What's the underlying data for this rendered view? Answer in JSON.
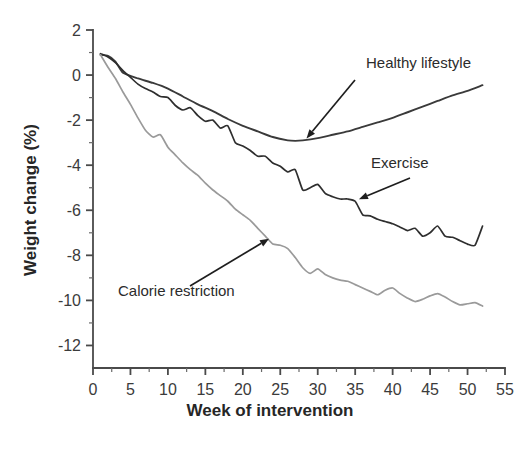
{
  "chart_data": {
    "type": "line",
    "title": "",
    "xlabel": "Week of intervention",
    "ylabel": "Weight change (%)",
    "xlim": [
      0,
      55
    ],
    "ylim": [
      -13,
      2
    ],
    "xticks": [
      0,
      5,
      10,
      15,
      20,
      25,
      30,
      35,
      40,
      45,
      50,
      55
    ],
    "xtick_labels": [
      "0",
      "5",
      "10",
      "15",
      "20",
      "25",
      "30",
      "35",
      "40",
      "45",
      "50",
      "55"
    ],
    "yticks": [
      2,
      0,
      -2,
      -4,
      -6,
      -8,
      -10,
      -12
    ],
    "ytick_labels": [
      "2",
      "0",
      "-2",
      "-4",
      "-6",
      "-8",
      "-10",
      "-12"
    ],
    "grid": false,
    "legend": "annotated-inline",
    "minor_ticks": true,
    "series": [
      {
        "name": "Healthy lifestyle",
        "color": "#3a3a3a",
        "width": 1.9,
        "x": [
          1,
          2,
          3,
          4,
          6,
          8,
          10,
          12,
          14,
          16,
          18,
          20,
          22,
          24,
          26,
          27,
          28,
          30,
          32,
          34,
          36,
          38,
          40,
          42,
          44,
          46,
          48,
          50,
          52
        ],
        "y": [
          0.9,
          0.85,
          0.6,
          0.1,
          -0.15,
          -0.35,
          -0.6,
          -0.95,
          -1.3,
          -1.6,
          -1.95,
          -2.25,
          -2.5,
          -2.75,
          -2.9,
          -2.92,
          -2.9,
          -2.8,
          -2.65,
          -2.5,
          -2.3,
          -2.1,
          -1.9,
          -1.65,
          -1.4,
          -1.15,
          -0.9,
          -0.7,
          -0.45
        ]
      },
      {
        "name": "Exercise",
        "color": "#2e2e2e",
        "width": 1.7,
        "x": [
          1,
          2,
          3,
          4,
          5,
          6,
          7,
          8,
          9,
          10,
          11,
          12,
          13,
          14,
          15,
          16,
          17,
          18,
          19,
          20,
          21,
          22,
          23,
          24,
          25,
          26,
          27,
          28,
          29,
          30,
          31,
          32,
          33,
          34,
          35,
          36,
          37,
          38,
          39,
          40,
          41,
          42,
          43,
          44,
          45,
          46,
          47,
          48,
          49,
          50,
          51,
          52
        ],
        "y": [
          0.95,
          0.8,
          0.55,
          0.2,
          -0.1,
          -0.4,
          -0.6,
          -0.75,
          -0.95,
          -1.0,
          -1.35,
          -1.55,
          -1.45,
          -1.8,
          -2.05,
          -2.0,
          -2.35,
          -2.25,
          -3.0,
          -3.15,
          -3.35,
          -3.6,
          -3.6,
          -3.9,
          -4.05,
          -4.3,
          -4.2,
          -5.1,
          -5.0,
          -4.85,
          -5.25,
          -5.4,
          -5.5,
          -5.5,
          -5.6,
          -6.2,
          -6.25,
          -6.4,
          -6.5,
          -6.6,
          -6.75,
          -6.9,
          -6.8,
          -7.15,
          -7.0,
          -6.7,
          -7.15,
          -7.2,
          -7.35,
          -7.5,
          -7.55,
          -6.7
        ]
      },
      {
        "name": "Calorie restriction",
        "color": "#9a9a9a",
        "width": 1.7,
        "x": [
          1,
          2,
          3,
          4,
          5,
          6,
          7,
          8,
          9,
          10,
          11,
          12,
          13,
          14,
          15,
          16,
          17,
          18,
          19,
          20,
          21,
          22,
          23,
          24,
          25,
          26,
          27,
          28,
          29,
          30,
          31,
          32,
          33,
          34,
          35,
          36,
          37,
          38,
          39,
          40,
          41,
          42,
          43,
          44,
          45,
          46,
          47,
          48,
          49,
          50,
          51,
          52
        ],
        "y": [
          0.9,
          0.35,
          -0.15,
          -0.75,
          -1.3,
          -1.9,
          -2.45,
          -2.75,
          -2.65,
          -3.2,
          -3.55,
          -3.9,
          -4.2,
          -4.45,
          -4.8,
          -5.1,
          -5.35,
          -5.6,
          -5.95,
          -6.2,
          -6.45,
          -6.8,
          -7.15,
          -7.5,
          -7.55,
          -7.7,
          -8.1,
          -8.55,
          -8.8,
          -8.6,
          -8.85,
          -9.0,
          -9.1,
          -9.15,
          -9.3,
          -9.45,
          -9.6,
          -9.75,
          -9.55,
          -9.45,
          -9.7,
          -9.9,
          -10.05,
          -9.95,
          -9.8,
          -9.7,
          -9.85,
          -10.05,
          -10.2,
          -10.15,
          -10.1,
          -10.25
        ]
      }
    ],
    "annotations": [
      {
        "text": "Healthy lifestyle",
        "target_week": 28.5,
        "target_value": -2.9
      },
      {
        "text": "Exercise",
        "target_week": 35.5,
        "target_value": -5.6
      },
      {
        "text": "Calorie restriction",
        "target_week": 23.5,
        "target_value": -7.35
      }
    ]
  },
  "colors": {
    "background": "#ffffff",
    "axis": "#4a4a4a",
    "text": "#2b2b2b",
    "healthy_lifestyle": "#3a3a3a",
    "exercise": "#2e2e2e",
    "calorie_restriction": "#9a9a9a"
  }
}
